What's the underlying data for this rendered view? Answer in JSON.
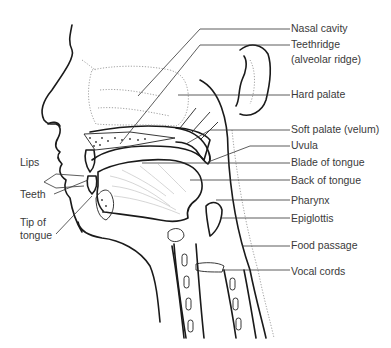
{
  "diagram": {
    "colors": {
      "ink": "#1a1a1a",
      "label_text": "#3a3a3a",
      "leader_line": "#333333",
      "background": "#ffffff"
    },
    "right_labels": [
      {
        "id": "nasal-cavity",
        "text": "Nasal cavity"
      },
      {
        "id": "teethridge",
        "text": "Teethridge"
      },
      {
        "id": "teethridge-alt",
        "text": "(alveolar ridge)"
      },
      {
        "id": "hard-palate",
        "text": "Hard palate"
      },
      {
        "id": "soft-palate",
        "text": "Soft palate (velum)"
      },
      {
        "id": "uvula",
        "text": "Uvula"
      },
      {
        "id": "blade-of-tongue",
        "text": "Blade of tongue"
      },
      {
        "id": "back-of-tongue",
        "text": "Back of tongue"
      },
      {
        "id": "pharynx",
        "text": "Pharynx"
      },
      {
        "id": "epiglottis",
        "text": "Epiglottis"
      },
      {
        "id": "food-passage",
        "text": "Food passage"
      },
      {
        "id": "vocal-cords",
        "text": "Vocal cords"
      }
    ],
    "left_labels": [
      {
        "id": "lips",
        "text": "Lips"
      },
      {
        "id": "teeth",
        "text": "Teeth"
      },
      {
        "id": "tip-of-tongue-1",
        "text": "Tip of"
      },
      {
        "id": "tip-of-tongue-2",
        "text": "tongue"
      }
    ]
  }
}
